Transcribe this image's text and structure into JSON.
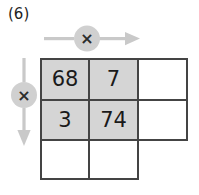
{
  "label": "(6)",
  "colors": {
    "shade": "#d5d5d5",
    "grid_line": "#444444",
    "arrow": "#c9c9c9",
    "badge_fill": "#d0d0d0",
    "text": "#1a1a1a"
  },
  "operators": {
    "row_operator": {
      "symbol": "×",
      "icon": "multiply-icon",
      "direction": "right"
    },
    "column_operator": {
      "symbol": "×",
      "icon": "multiply-icon",
      "direction": "down"
    }
  },
  "grid": {
    "rows": 3,
    "cols": 3,
    "cells": [
      [
        {
          "value": "68",
          "shaded": true,
          "bordered": true
        },
        {
          "value": "7",
          "shaded": true,
          "bordered": true
        },
        {
          "value": "",
          "shaded": false,
          "bordered": true
        }
      ],
      [
        {
          "value": "3",
          "shaded": true,
          "bordered": true
        },
        {
          "value": "74",
          "shaded": true,
          "bordered": true
        },
        {
          "value": "",
          "shaded": false,
          "bordered": true
        }
      ],
      [
        {
          "value": "",
          "shaded": false,
          "bordered": true
        },
        {
          "value": "",
          "shaded": false,
          "bordered": true
        },
        {
          "value": "",
          "shaded": false,
          "bordered": false
        }
      ]
    ]
  }
}
